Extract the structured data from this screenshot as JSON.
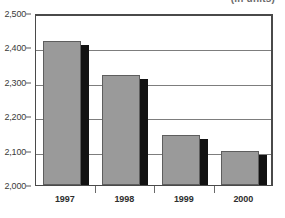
{
  "chart_data": {
    "type": "bar",
    "title": "",
    "units_caption": "(in units)",
    "xlabel": "",
    "ylabel": "",
    "categories": [
      "1997",
      "1998",
      "1999",
      "2000"
    ],
    "values": [
      2420,
      2320,
      2145,
      2098
    ],
    "series": [
      {
        "name": "Total",
        "values": [
          2420,
          2320,
          2145,
          2098
        ]
      }
    ],
    "ylim": [
      2000,
      2500
    ],
    "ytick_step": 100,
    "ytick_labels": [
      "2,500",
      "2,400",
      "2,300",
      "2,200",
      "2,100",
      "2,000"
    ],
    "ytick_values": [
      2500,
      2400,
      2300,
      2200,
      2100,
      2000
    ],
    "grid": true,
    "legend": false,
    "legend_position": "none",
    "bar_color": "#9a9a9a",
    "bar_shadow_color": "#121212",
    "gridline_color": "#7d7d7d",
    "axis_color": "#4a4a4a",
    "background_color": "#ffffff"
  }
}
